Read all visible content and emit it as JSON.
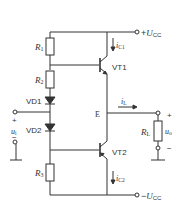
{
  "diagram": {
    "type": "complementary push-pull power amplifier (OCL, class AB)",
    "colors": {
      "wire": "#333333",
      "background": "#ffffff"
    },
    "supply": {
      "positive": {
        "sign": "+",
        "symbol": "U",
        "sub": "CC"
      },
      "negative": {
        "sign": "−",
        "symbol": "U",
        "sub": "CC"
      }
    },
    "resistors": {
      "r1": {
        "symbol": "R",
        "sub": "1"
      },
      "r2": {
        "symbol": "R",
        "sub": "2"
      },
      "r3": {
        "symbol": "R",
        "sub": "3"
      },
      "rl": {
        "symbol": "R",
        "sub": "L"
      }
    },
    "diodes": {
      "vd1": {
        "label": "VD1"
      },
      "vd2": {
        "label": "VD2"
      }
    },
    "transistors": {
      "vt1": {
        "label": "VT1",
        "type": "NPN"
      },
      "vt2": {
        "label": "VT2",
        "type": "PNP"
      }
    },
    "currents": {
      "ic1": {
        "symbol": "i",
        "sub": "C1"
      },
      "ic2": {
        "symbol": "i",
        "sub": "C2"
      },
      "il": {
        "symbol": "i",
        "sub": "L"
      }
    },
    "nodes": {
      "emitter": "E"
    },
    "input": {
      "symbol": "u",
      "sub": "i",
      "plus": "+",
      "minus": "−"
    },
    "output": {
      "symbol": "u",
      "sub": "o",
      "plus": "+",
      "minus": "−"
    }
  }
}
